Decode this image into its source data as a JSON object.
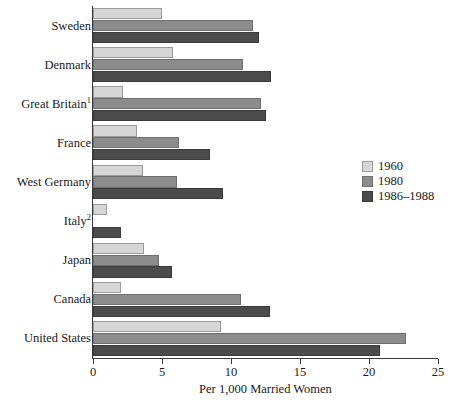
{
  "chart_data": {
    "type": "bar",
    "orientation": "horizontal",
    "title": "",
    "xlabel": "Per 1,000 Married Women",
    "ylabel": "",
    "xlim": [
      0,
      25
    ],
    "xticks": [
      0,
      5,
      10,
      15,
      20,
      25
    ],
    "xtick_labels": [
      "0",
      "5",
      "10",
      "15",
      "20",
      "25"
    ],
    "grid": false,
    "legend_position": "right",
    "categories": [
      "Sweden",
      "Denmark",
      "Great Britain",
      "France",
      "West Germany",
      "Italy",
      "Japan",
      "Canada",
      "United States"
    ],
    "category_footnotes": [
      "",
      "",
      "1",
      "",
      "",
      "2",
      "",
      "",
      ""
    ],
    "series": [
      {
        "name": "1960",
        "color": "#d6d6d6",
        "values": [
          5.0,
          5.8,
          2.2,
          3.2,
          3.6,
          1.0,
          3.7,
          2.0,
          9.3
        ]
      },
      {
        "name": "1980",
        "color": "#8c8c8c",
        "values": [
          11.6,
          10.9,
          12.2,
          6.2,
          6.1,
          0.0,
          4.8,
          10.7,
          22.7
        ]
      },
      {
        "name": "1986–1988",
        "color": "#4b4b4b",
        "values": [
          12.0,
          12.9,
          12.5,
          8.5,
          9.4,
          2.0,
          5.7,
          12.8,
          20.8
        ]
      }
    ]
  },
  "colors": {
    "series_1960": "#d6d6d6",
    "series_1980": "#8c8c8c",
    "series_1986_1988": "#4b4b4b",
    "axis": "#3a3a3a",
    "text": "#1a1a1a",
    "background": "#ffffff"
  }
}
